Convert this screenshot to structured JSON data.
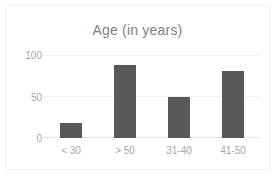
{
  "chart_data": {
    "type": "bar",
    "title": "Age (in years)",
    "xlabel": "",
    "ylabel": "",
    "categories": [
      "< 30",
      "> 50",
      "31-40",
      "41-50"
    ],
    "values": [
      18,
      88,
      50,
      81
    ],
    "ylim": [
      0,
      100
    ],
    "yticks": [
      0,
      50,
      100
    ],
    "ytick_labels": [
      "0",
      "50",
      "100"
    ],
    "grid": true,
    "grid_axis": "y",
    "legend": false,
    "bar_color": "#595959",
    "title_color": "#808080",
    "tick_label_color": "#a6a6a6",
    "gridline_color": "#f0f0f0",
    "plot_background": "#ffffff",
    "border_color": "#f2f2f2"
  }
}
